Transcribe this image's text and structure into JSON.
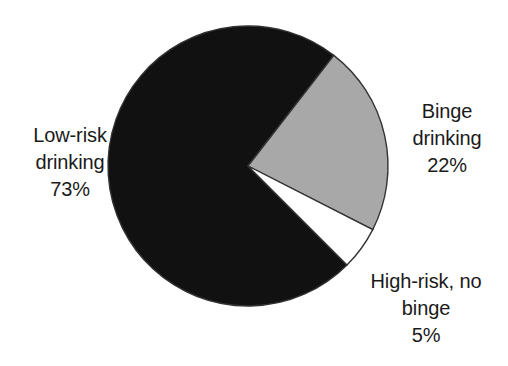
{
  "chart_data": {
    "type": "pie",
    "title": "",
    "subtitle": "",
    "xlabel": "",
    "ylabel": "",
    "legend_position": "none",
    "grid": false,
    "categories": [
      "Low-risk drinking",
      "Binge drinking",
      "High-risk, no binge"
    ],
    "values": [
      73,
      22,
      5
    ],
    "value_unit": "%",
    "slice_colors": [
      "#111111",
      "#a8a8a8",
      "#ffffff"
    ],
    "outline_color": "#333333",
    "background_color": "#ffffff",
    "slices": [
      {
        "label": "Low-risk drinking",
        "value": 73,
        "value_text": "73%",
        "color": "#111111",
        "start_angle_deg": 45,
        "end_angle_deg": 307.8,
        "label_lines": [
          "Low-risk",
          "drinking",
          "73%"
        ],
        "label_position": "left"
      },
      {
        "label": "Binge drinking",
        "value": 22,
        "value_text": "22%",
        "color": "#a8a8a8",
        "start_angle_deg": 307.8,
        "end_angle_deg": 27,
        "label_lines": [
          "Binge",
          "drinking",
          "22%"
        ],
        "label_position": "right"
      },
      {
        "label": "High-risk, no binge",
        "value": 5,
        "value_text": "5%",
        "color": "#ffffff",
        "start_angle_deg": 27,
        "end_angle_deg": 45,
        "label_lines": [
          "High-risk, no",
          "binge",
          "5%"
        ],
        "label_position": "bottom-right"
      }
    ]
  },
  "labels": {
    "low_risk": {
      "line1": "Low-risk",
      "line2": "drinking",
      "line3": "73%"
    },
    "binge": {
      "line1": "Binge",
      "line2": "drinking",
      "line3": "22%"
    },
    "high_risk": {
      "line1": "High-risk, no",
      "line2": "binge",
      "line3": "5%"
    }
  }
}
